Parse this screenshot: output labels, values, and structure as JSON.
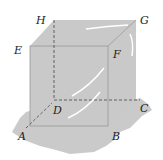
{
  "figure": {
    "type": "transparent-cube",
    "fill_color": "#c9c9c9",
    "edge_color": "#8a8a8a",
    "highlight_color": "#ffffff",
    "vertices": [
      {
        "name": "H",
        "label": "H"
      },
      {
        "name": "G",
        "label": "G"
      },
      {
        "name": "E",
        "label": "E"
      },
      {
        "name": "F",
        "label": "F"
      },
      {
        "name": "D",
        "label": "D"
      },
      {
        "name": "C",
        "label": "C"
      },
      {
        "name": "A",
        "label": "A"
      },
      {
        "name": "B",
        "label": "B"
      }
    ]
  }
}
